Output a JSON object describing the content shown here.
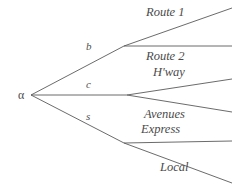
{
  "diagram": {
    "type": "decision-tree",
    "root": {
      "label": "α",
      "x": 18,
      "y": 89
    },
    "branch_keys": [
      {
        "id": "b",
        "label": "b",
        "x": 86,
        "y": 41
      },
      {
        "id": "c",
        "label": "c",
        "x": 86,
        "y": 79
      },
      {
        "id": "s",
        "label": "s",
        "x": 86,
        "y": 111
      }
    ],
    "leaves": [
      {
        "id": "route-1",
        "label": "Route 1",
        "x": 146,
        "y": 6
      },
      {
        "id": "route-2",
        "label": "Route 2",
        "x": 146,
        "y": 50
      },
      {
        "id": "hway",
        "label": "H'way",
        "x": 153,
        "y": 66
      },
      {
        "id": "avenues",
        "label": "Avenues",
        "x": 144,
        "y": 108
      },
      {
        "id": "express",
        "label": "Express",
        "x": 141,
        "y": 123
      },
      {
        "id": "local",
        "label": "Local",
        "x": 160,
        "y": 161
      }
    ],
    "edges": [
      {
        "id": "root-to-b",
        "from": "root",
        "to": "fork-b",
        "x1": 31,
        "y1": 95,
        "x2": 124,
        "y2": 46
      },
      {
        "id": "root-to-c",
        "from": "root",
        "to": "fork-c",
        "x1": 31,
        "y1": 95,
        "x2": 127,
        "y2": 95
      },
      {
        "id": "root-to-s",
        "from": "root",
        "to": "fork-s",
        "x1": 31,
        "y1": 95,
        "x2": 124,
        "y2": 143
      },
      {
        "id": "b-to-route-1",
        "from": "fork-b",
        "to": "route-1",
        "x1": 124,
        "y1": 46,
        "x2": 232,
        "y2": 8
      },
      {
        "id": "b-to-route-2",
        "from": "fork-b",
        "to": "route-2",
        "x1": 124,
        "y1": 46,
        "x2": 232,
        "y2": 46
      },
      {
        "id": "c-to-hway",
        "from": "fork-c",
        "to": "hway",
        "x1": 127,
        "y1": 95,
        "x2": 232,
        "y2": 79
      },
      {
        "id": "c-to-avenues",
        "from": "fork-c",
        "to": "avenues",
        "x1": 127,
        "y1": 95,
        "x2": 232,
        "y2": 112
      },
      {
        "id": "s-to-express",
        "from": "fork-s",
        "to": "express",
        "x1": 124,
        "y1": 143,
        "x2": 232,
        "y2": 141
      },
      {
        "id": "s-to-local",
        "from": "fork-s",
        "to": "local",
        "x1": 124,
        "y1": 143,
        "x2": 232,
        "y2": 183
      }
    ],
    "style": {
      "line_color": "#5a5a5a",
      "line_width": 0.9,
      "text_color": "#4a4a4a",
      "background": "#ffffff"
    }
  }
}
